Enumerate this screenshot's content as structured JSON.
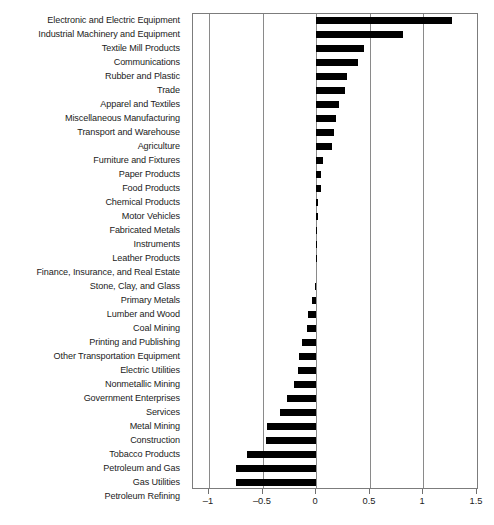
{
  "chart_data": {
    "type": "bar",
    "orientation": "horizontal",
    "title": "",
    "subtitle": "",
    "xlabel": "",
    "ylabel": "",
    "xlim": [
      -1.15,
      1.5
    ],
    "xticks": [
      -1,
      -0.5,
      0,
      0.5,
      1,
      1.5
    ],
    "xtick_labels": [
      "–1",
      "–0.5",
      "0",
      "0.5",
      "1",
      "1.5"
    ],
    "grid": true,
    "grid_axis": "x",
    "legend": null,
    "bar_color": "#000000",
    "axis_color": "#7c7c7c",
    "categories": [
      "Electronic and Electric Equipment",
      "Industrial Machinery and Equipment",
      "Textile Mill Products",
      "Communications",
      "Rubber and Plastic",
      "Trade",
      "Apparel and Textiles",
      "Miscellaneous Manufacturing",
      "Transport and Warehouse",
      "Agriculture",
      "Furniture and Fixtures",
      "Paper Products",
      "Food Products",
      "Chemical Products",
      "Motor Vehicles",
      "Fabricated Metals",
      "Instruments",
      "Leather Products",
      "Finance, Insurance, and Real Estate",
      "Stone, Clay, and Glass",
      "Primary Metals",
      "Lumber and Wood",
      "Coal Mining",
      "Printing and Publishing",
      "Other Transportation Equipment",
      "Electric Utilities",
      "Nonmetallic Mining",
      "Government Enterprises",
      "Services",
      "Metal Mining",
      "Construction",
      "Tobacco Products",
      "Petroleum and Gas",
      "Gas Utilities",
      "Petroleum Refining"
    ],
    "values": [
      1.27,
      0.81,
      0.45,
      0.39,
      0.29,
      0.27,
      0.21,
      0.18,
      0.17,
      0.15,
      0.06,
      0.04,
      0.04,
      0.02,
      0.02,
      0.01,
      0.01,
      0.01,
      0.0,
      -0.01,
      -0.04,
      -0.08,
      -0.09,
      -0.13,
      -0.16,
      -0.17,
      -0.21,
      -0.27,
      -0.34,
      -0.46,
      -0.47,
      -0.65,
      -0.75,
      -0.75,
      -0.77
    ]
  }
}
